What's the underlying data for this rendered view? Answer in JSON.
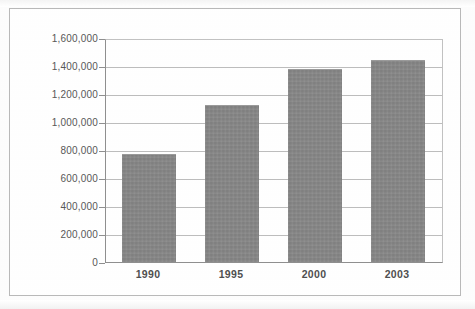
{
  "chart_data": {
    "type": "bar",
    "title": "",
    "subtitle": "",
    "xlabel": "",
    "ylabel": "",
    "categories": [
      "1990",
      "1995",
      "2000",
      "2003"
    ],
    "values": [
      770000,
      1125000,
      1380000,
      1445000
    ],
    "series": [
      {
        "name": "",
        "values": [
          770000,
          1125000,
          1380000,
          1445000
        ]
      }
    ],
    "ylim": [
      0,
      1600000
    ],
    "ytick_values": [
      0,
      200000,
      400000,
      600000,
      800000,
      1000000,
      1200000,
      1400000,
      1600000
    ],
    "ytick_labels": [
      "0",
      "200,000",
      "400,000",
      "600,000",
      "800,000",
      "1,000,000",
      "1,200,000",
      "1,400,000",
      "1,600,000"
    ],
    "grid": true,
    "grid_axis": "y",
    "legend": false,
    "legend_position": "none",
    "annotations": [],
    "colors": {
      "bar_fill": "#878787",
      "bar_edge": "#9a9a9a",
      "gridline": "#bdbdbd",
      "axis_line": "#8f8f8f",
      "frame_border": "#b9b9b9",
      "tick_label_text": "#575757",
      "category_label_text": "#4f4f4f",
      "plot_background": "#ffffff",
      "figure_background": "#fdfdfd"
    }
  }
}
